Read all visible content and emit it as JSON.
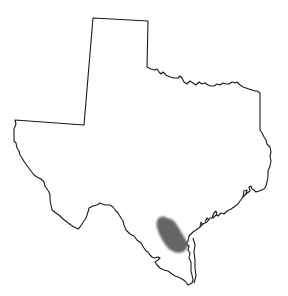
{
  "map": {
    "region": "Texas",
    "type": "range-map",
    "background": "#ffffff",
    "outline_color": "#1a1a1a",
    "range_color": "#555555",
    "shaded_area": "South Texas coastal bend, inland of Corpus Christi"
  }
}
